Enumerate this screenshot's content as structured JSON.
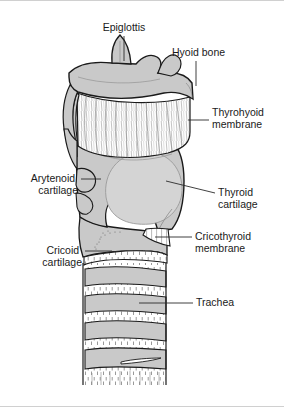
{
  "figure": {
    "background_color": "#ffffff",
    "border_color": "#d0d0d0",
    "cartilage_fill": "#c9c9c9",
    "cartilage_fill_light": "#d4d4d4",
    "membrane_fill": "#ffffff",
    "outline_color": "#1a1a1a",
    "label_color": "#1a1a1a",
    "leader_color": "#2b2b2b"
  },
  "labels": [
    {
      "id": "epiglottis",
      "text": "Epiglottis",
      "align": "middle",
      "x": 124,
      "y": 27,
      "leader": "M124,35 L124,60"
    },
    {
      "id": "hyoid-bone",
      "text": "Hyoid bone",
      "align": "start",
      "x": 172,
      "y": 52,
      "leader": "M196,60 L196,85"
    },
    {
      "id": "thyrohyoid-membrane",
      "line1": "Thyrohyoid",
      "line2": "membrane",
      "align": "start",
      "x": 212,
      "y": 112,
      "leader": "M188,119 L209,119"
    },
    {
      "id": "arytenoid-cartilage",
      "line1": "Arytenoid",
      "line2": "cartilage",
      "align": "end",
      "x": 78,
      "y": 183,
      "leader": "M81,178 L101,178"
    },
    {
      "id": "thyroid-cartilage",
      "line1": "Thyroid",
      "line2": "cartilage",
      "align": "start",
      "x": 218,
      "y": 192,
      "leader": "M166,180 L215,192"
    },
    {
      "id": "cricothyroid-membrane",
      "line1": "Cricothyroid",
      "line2": "membrane",
      "align": "start",
      "x": 195,
      "y": 239,
      "leader": "M155,236 L192,236"
    },
    {
      "id": "cricoid-cartilage",
      "line1": "Cricoid",
      "line2": "cartilage",
      "align": "end",
      "x": 82,
      "y": 256,
      "leader": "M85,250 L112,250"
    },
    {
      "id": "trachea",
      "text": "Trachea",
      "align": "start",
      "x": 196,
      "y": 302,
      "leader": "M139,302 L193,302"
    }
  ],
  "structures": [
    {
      "id": "epiglottis-shape",
      "name": "Epiglottis"
    },
    {
      "id": "hyoid-bone-shape",
      "name": "Hyoid bone"
    },
    {
      "id": "thyrohyoid-membrane-shape",
      "name": "Thyrohyoid membrane"
    },
    {
      "id": "thyroid-cartilage-shape",
      "name": "Thyroid cartilage"
    },
    {
      "id": "arytenoid-cartilage-shape",
      "name": "Arytenoid cartilage"
    },
    {
      "id": "cricoid-cartilage-shape",
      "name": "Cricoid cartilage"
    },
    {
      "id": "cricothyroid-membrane-shape",
      "name": "Cricothyroid membrane"
    },
    {
      "id": "trachea-shape",
      "name": "Trachea"
    }
  ],
  "trachea_rings": [
    {
      "index": 1,
      "top": 268,
      "height": 17
    },
    {
      "index": 2,
      "top": 295,
      "height": 17
    },
    {
      "index": 3,
      "top": 322,
      "height": 17
    },
    {
      "index": 4,
      "top": 349,
      "height": 19
    }
  ]
}
